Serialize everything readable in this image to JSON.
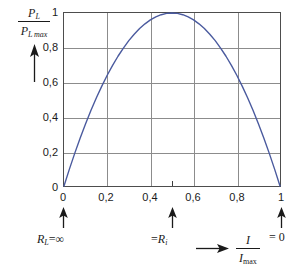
{
  "chart_data": {
    "type": "line",
    "title": "",
    "subtitle": "",
    "xlabel": "I / Imax",
    "ylabel": "PL / PLmax",
    "xlim": [
      0,
      1
    ],
    "ylim": [
      0,
      1
    ],
    "grid": true,
    "legend": "none",
    "equation": "y = 4x(1 - x)",
    "x_ticks": [
      "0",
      "0,2",
      "0,4",
      "0,6",
      "0,8",
      "1"
    ],
    "x_tick_values": [
      0,
      0.2,
      0.4,
      0.6,
      0.8,
      1
    ],
    "y_ticks": [
      "0",
      "0,2",
      "0,4",
      "0,6",
      "0,8",
      "1"
    ],
    "y_tick_values": [
      0,
      0.2,
      0.4,
      0.6,
      0.8,
      1
    ],
    "minor_x_tick_values": [
      0.5
    ],
    "series": [
      {
        "name": "PL/PLmax",
        "color": "#4a5a9e",
        "x": [
          0,
          0.025,
          0.05,
          0.075,
          0.1,
          0.125,
          0.15,
          0.175,
          0.2,
          0.225,
          0.25,
          0.275,
          0.3,
          0.325,
          0.35,
          0.375,
          0.4,
          0.425,
          0.45,
          0.475,
          0.5,
          0.525,
          0.55,
          0.575,
          0.6,
          0.625,
          0.65,
          0.675,
          0.7,
          0.725,
          0.75,
          0.775,
          0.8,
          0.825,
          0.85,
          0.875,
          0.9,
          0.925,
          0.95,
          0.975,
          1
        ],
        "values": [
          0,
          0.0975,
          0.19,
          0.2775,
          0.36,
          0.4375,
          0.51,
          0.5775,
          0.64,
          0.6975,
          0.75,
          0.7975,
          0.84,
          0.8775,
          0.91,
          0.9375,
          0.96,
          0.9775,
          0.99,
          0.9975,
          1,
          0.9975,
          0.99,
          0.9775,
          0.96,
          0.9375,
          0.91,
          0.8775,
          0.84,
          0.7975,
          0.75,
          0.6975,
          0.64,
          0.5775,
          0.51,
          0.4375,
          0.36,
          0.2775,
          0.19,
          0.0975,
          0
        ]
      }
    ],
    "annotations": [
      {
        "id": "annotation-r-infinity",
        "at_x": 0,
        "marker": "up-arrow",
        "text_plain": "RL = ∞"
      },
      {
        "id": "annotation-r-internal",
        "at_x": 0.5,
        "marker": "up-arrow",
        "text_plain": "= Ri"
      },
      {
        "id": "annotation-r-zero",
        "at_x": 1,
        "marker": "up-arrow",
        "text_plain": "= 0"
      }
    ]
  },
  "axis_labels": {
    "y_numerator_symbol": "P",
    "y_numerator_sub": "L",
    "y_denominator_symbol": "P",
    "y_denominator_sub": "L max",
    "x_numerator_symbol": "I",
    "x_denominator_symbol": "I",
    "x_denominator_sub": "max"
  },
  "annotation_labels": {
    "left_symbol": "R",
    "left_sub": "L",
    "left_equals": "=",
    "left_value": "∞",
    "mid_equals": "=",
    "mid_symbol": "R",
    "mid_sub": "i",
    "right_equals": "= 0"
  },
  "ticks": {
    "y": [
      "1",
      "0,8",
      "0,6",
      "0,4",
      "0,2",
      "0"
    ],
    "x": [
      "0",
      "0,2",
      "0,4",
      "0,6",
      "0,8",
      "1"
    ]
  },
  "colors": {
    "curve": "#4a5a9e",
    "grid": "#8c8c8c",
    "frame": "#4d4d4d",
    "text": "#1a1a1a",
    "background": "#ffffff"
  },
  "caption": {
    "cropped_text": " "
  }
}
